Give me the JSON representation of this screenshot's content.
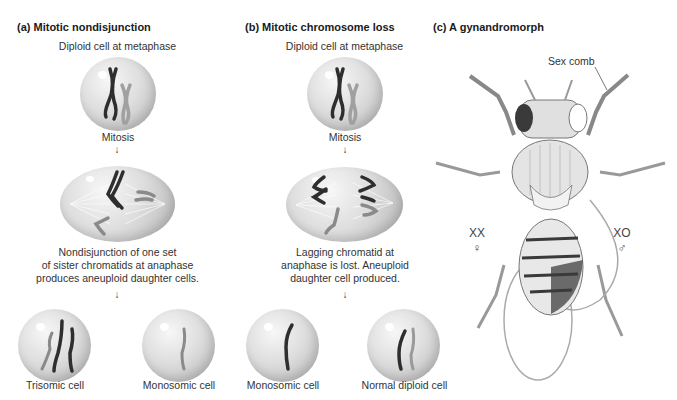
{
  "panels": [
    {
      "id": "a",
      "title": "(a)  Mitotic nondisjunction",
      "top_label": "Diploid cell at metaphase",
      "mid_label": "Mitosis",
      "caption_lines": [
        "Nondisjunction of one set",
        "of sister chromatids at anaphase",
        "produces aneuploid daughter cells."
      ],
      "daughter_cells": [
        {
          "label": "Trisomic cell"
        },
        {
          "label": "Monosomic cell"
        }
      ]
    },
    {
      "id": "b",
      "title": "(b)  Mitotic chromosome loss",
      "top_label": "Diploid cell at metaphase",
      "mid_label": "Mitosis",
      "caption_lines": [
        "Lagging chromatid at",
        "anaphase is lost. Aneuploid",
        "daughter cell produced."
      ],
      "daughter_cells": [
        {
          "label": "Monosomic cell"
        },
        {
          "label": "Normal diploid cell"
        }
      ]
    },
    {
      "id": "c",
      "title": "(c)  A gynandromorph",
      "annotation": "Sex comb",
      "left_genotype": "XX",
      "left_symbol": "♀",
      "right_genotype": "XO",
      "right_symbol": "♂"
    }
  ],
  "arrow_glyph": "↓",
  "colors": {
    "chromosome_dark": "#2e2e2e",
    "chromosome_light": "#9a9a9a",
    "cell_fill": "#d4d4d4",
    "fly_outline": "#6a6a6a",
    "fly_dark": "#3a3a3a"
  }
}
